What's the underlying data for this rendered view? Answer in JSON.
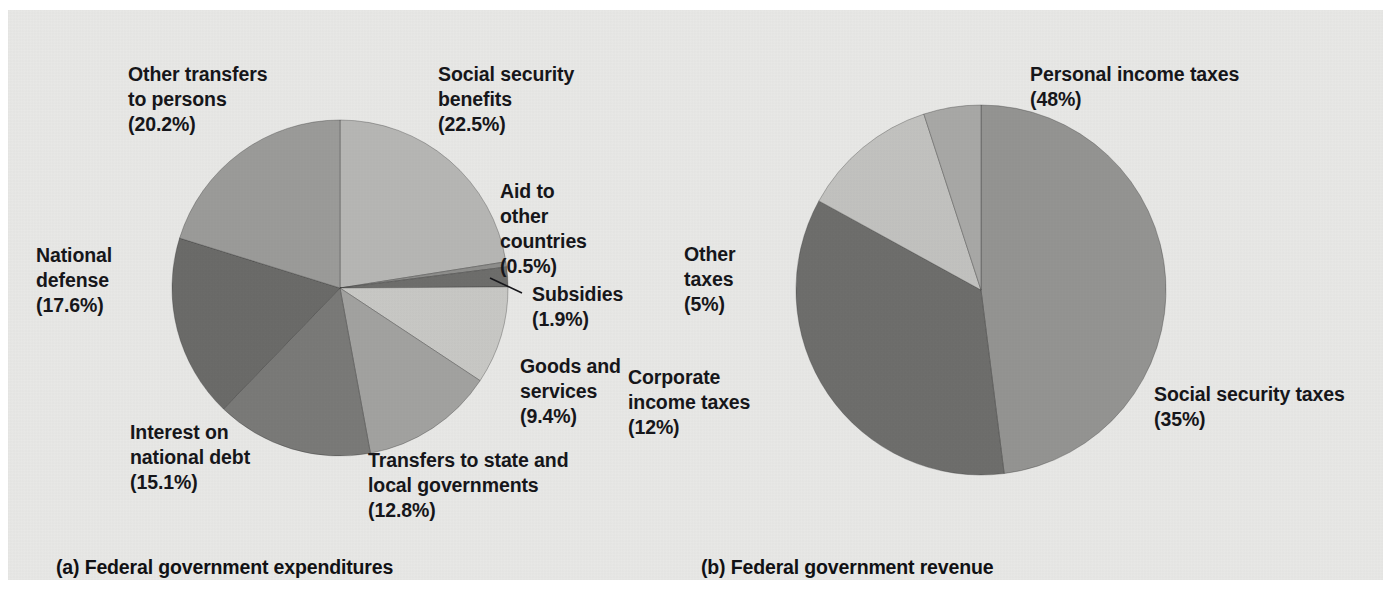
{
  "figure": {
    "background_color": "#e8e8e6",
    "text_color": "#16161a"
  },
  "captions": {
    "left": "(a) Federal government expenditures",
    "right": "(b) Federal government revenue"
  },
  "labels": {
    "expenditures": {
      "other_transfers": "Other transfers\nto persons\n(20.2%)",
      "social_security": "Social security\nbenefits\n(22.5%)",
      "aid_other": "Aid to\nother\ncountries\n(0.5%)",
      "subsidies": "Subsidies\n(1.9%)",
      "goods_services": "Goods and\nservices\n(9.4%)",
      "transfers_state": "Transfers to state and\nlocal governments\n(12.8%)",
      "interest": "Interest on\nnational debt\n(15.1%)",
      "defense": "National\ndefense\n(17.6%)"
    },
    "revenue": {
      "personal": "Personal income taxes\n(48%)",
      "social_security": "Social security taxes\n(35%)",
      "corporate": "Corporate\nincome taxes\n(12%)",
      "other": "Other\ntaxes\n(5%)"
    }
  },
  "chart_data": [
    {
      "type": "pie",
      "title": "(a) Federal government expenditures",
      "id": "federal-government-expenditures",
      "center": [
        332,
        278
      ],
      "radius": 168,
      "start_angle_deg": 0,
      "direction": "clockwise",
      "total": 100,
      "unit": "percent",
      "legend": "labels placed around pie",
      "slices": [
        {
          "label": "Social security benefits",
          "value": 22.5,
          "display": "(22.5%)",
          "color": "#b6b6b4"
        },
        {
          "label": "Aid to other countries",
          "value": 0.5,
          "display": "(0.5%)",
          "color": "#8e8e8c"
        },
        {
          "label": "Subsidies",
          "value": 1.9,
          "display": "(1.9%)",
          "color": "#6e6e6c"
        },
        {
          "label": "Goods and services",
          "value": 9.4,
          "display": "(9.4%)",
          "color": "#c8c8c5"
        },
        {
          "label": "Transfers to state and local governments",
          "value": 12.8,
          "display": "(12.8%)",
          "color": "#a2a2a0"
        },
        {
          "label": "Interest on national debt",
          "value": 15.1,
          "display": "(15.1%)",
          "color": "#7a7a78"
        },
        {
          "label": "National defense",
          "value": 17.6,
          "display": "(17.6%)",
          "color": "#6b6b69"
        },
        {
          "label": "Other transfers to persons",
          "value": 20.2,
          "display": "(20.2%)",
          "color": "#9b9b99"
        }
      ]
    },
    {
      "type": "pie",
      "title": "(b) Federal government revenue",
      "id": "federal-government-revenue",
      "center": [
        973,
        280
      ],
      "radius": 185,
      "start_angle_deg": 0,
      "direction": "clockwise",
      "total": 100,
      "unit": "percent",
      "legend": "labels placed around pie",
      "slices": [
        {
          "label": "Personal income taxes",
          "value": 48,
          "display": "(48%)",
          "color": "#949492"
        },
        {
          "label": "Social security taxes",
          "value": 35,
          "display": "(35%)",
          "color": "#6e6e6c"
        },
        {
          "label": "Corporate income taxes",
          "value": 12,
          "display": "(12%)",
          "color": "#c2c2bf"
        },
        {
          "label": "Other taxes",
          "value": 5,
          "display": "(5%)",
          "color": "#a8a8a6"
        }
      ]
    }
  ]
}
